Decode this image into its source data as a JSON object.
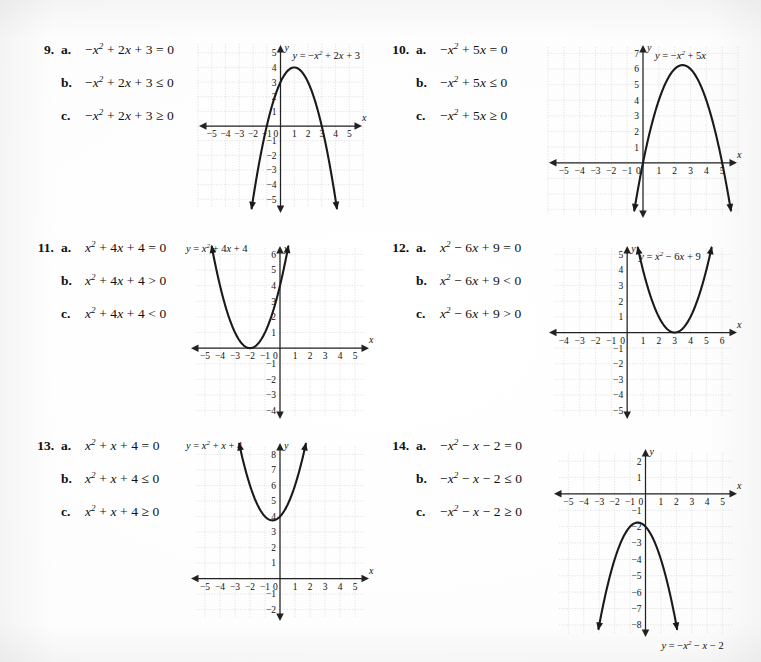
{
  "page": {
    "background": "#ffffff",
    "ink": "#111111",
    "grid_color": "#c9c9c9",
    "axis_color": "#222222",
    "curve_color": "#1a1a1a"
  },
  "problems": [
    {
      "number": "9.",
      "parts": [
        {
          "letter": "a.",
          "expression": "−x² + 2x + 3 = 0"
        },
        {
          "letter": "b.",
          "expression": "−x² + 2x + 3 ≤ 0"
        },
        {
          "letter": "c.",
          "expression": "−x² + 2x + 3 ≥ 0"
        }
      ]
    },
    {
      "number": "10.",
      "parts": [
        {
          "letter": "a.",
          "expression": "−x² + 5x = 0"
        },
        {
          "letter": "b.",
          "expression": "−x² + 5x ≤ 0"
        },
        {
          "letter": "c.",
          "expression": "−x² + 5x ≥ 0"
        }
      ]
    },
    {
      "number": "11.",
      "parts": [
        {
          "letter": "a.",
          "expression": "x² + 4x + 4 = 0"
        },
        {
          "letter": "b.",
          "expression": "x² + 4x + 4 > 0"
        },
        {
          "letter": "c.",
          "expression": "x² + 4x + 4 < 0"
        }
      ]
    },
    {
      "number": "12.",
      "parts": [
        {
          "letter": "a.",
          "expression": "x² − 6x + 9 = 0"
        },
        {
          "letter": "b.",
          "expression": "x² − 6x + 9 < 0"
        },
        {
          "letter": "c.",
          "expression": "x² − 6x + 9 > 0"
        }
      ]
    },
    {
      "number": "13.",
      "parts": [
        {
          "letter": "a.",
          "expression": "x² + x + 4 = 0"
        },
        {
          "letter": "b.",
          "expression": "x² + x + 4 ≤ 0"
        },
        {
          "letter": "c.",
          "expression": "x² + x + 4 ≥ 0"
        }
      ]
    },
    {
      "number": "14.",
      "parts": [
        {
          "letter": "a.",
          "expression": "−x² − x − 2 = 0"
        },
        {
          "letter": "b.",
          "expression": "−x² − x − 2 ≤ 0"
        },
        {
          "letter": "c.",
          "expression": "−x² − x − 2 ≥ 0"
        }
      ]
    }
  ],
  "chart_data": [
    {
      "id": "graph-9",
      "type": "line",
      "title": "y = −x² + 2x + 3",
      "label_text": "y = −x² + 2x + 3",
      "label_pos": "top-right",
      "xlabel": "x",
      "ylabel": "y",
      "coefficients": {
        "a": -1,
        "b": 2,
        "c": 3
      },
      "vertex": [
        1,
        4
      ],
      "roots": [
        -1,
        3
      ],
      "xlim": [
        -6,
        6
      ],
      "ylim": [
        -6,
        5.6
      ],
      "xticks": [
        -5,
        -4,
        -3,
        -2,
        -1,
        0,
        1,
        2,
        3,
        4,
        5
      ],
      "yticks": [
        -5,
        -4,
        -3,
        -2,
        -1,
        1,
        2,
        3,
        4,
        5
      ],
      "xtick_labels": [
        "−5",
        "−4",
        "−3",
        "−2",
        "−1",
        "0",
        "1",
        "2",
        "3",
        "4",
        "5"
      ],
      "ytick_labels": [
        "−5",
        "−4",
        "−3",
        "−2",
        "−1",
        "1",
        "2",
        "3",
        "4",
        "5"
      ],
      "grid": true,
      "grid_x": [
        -6,
        6
      ],
      "grid_y": [
        -5.6,
        5.6
      ],
      "curve_domain": [
        -2.1,
        4.1
      ],
      "arrows": "both-down"
    },
    {
      "id": "graph-10",
      "type": "line",
      "title": "y = −x² + 5x",
      "label_text": "y = −x² + 5x",
      "label_pos": "top-right",
      "xlabel": "x",
      "ylabel": "y",
      "coefficients": {
        "a": -1,
        "b": 5,
        "c": 0
      },
      "vertex": [
        2.5,
        6.25
      ],
      "roots": [
        0,
        5
      ],
      "xlim": [
        -6,
        6
      ],
      "ylim": [
        -3.6,
        7.6
      ],
      "xticks": [
        -5,
        -4,
        -3,
        -2,
        -1,
        0,
        1,
        2,
        3,
        4,
        5
      ],
      "yticks": [
        1,
        2,
        3,
        4,
        5,
        6,
        7
      ],
      "xtick_labels": [
        "−5",
        "−4",
        "−3",
        "−2",
        "−1",
        "0",
        "1",
        "2",
        "3",
        "4",
        "5"
      ],
      "ytick_labels": [
        "1",
        "2",
        "3",
        "4",
        "5",
        "6",
        "7"
      ],
      "grid": true,
      "grid_x": [
        -6,
        6
      ],
      "grid_y": [
        -3.4,
        7.4
      ],
      "curve_domain": [
        -0.55,
        5.55
      ],
      "arrows": "both-down"
    },
    {
      "id": "graph-11",
      "type": "line",
      "title": "y = x² + 4x + 4",
      "label_text": "y = x² + 4x + 4",
      "label_pos": "top-left",
      "xlabel": "x",
      "ylabel": "y",
      "coefficients": {
        "a": 1,
        "b": 4,
        "c": 4
      },
      "vertex": [
        -2,
        0
      ],
      "roots": [
        -2
      ],
      "xlim": [
        -6,
        6
      ],
      "ylim": [
        -4.6,
        6.6
      ],
      "xticks": [
        -5,
        -4,
        -3,
        -2,
        -1,
        0,
        1,
        2,
        3,
        4,
        5
      ],
      "yticks": [
        -4,
        -3,
        -2,
        -1,
        1,
        2,
        3,
        4,
        5,
        6
      ],
      "xtick_labels": [
        "−5",
        "−4",
        "−3",
        "−2",
        "−1",
        "0",
        "1",
        "2",
        "3",
        "4",
        "5"
      ],
      "ytick_labels": [
        "−4",
        "−3",
        "−2",
        "−1",
        "1",
        "2",
        "3",
        "4",
        "5",
        "6"
      ],
      "grid": true,
      "grid_x": [
        -5.6,
        5.6
      ],
      "grid_y": [
        -4.4,
        6.4
      ],
      "curve_domain": [
        -4.55,
        0.55
      ],
      "arrows": "both-up"
    },
    {
      "id": "graph-12",
      "type": "line",
      "title": "y = x² − 6x + 9",
      "label_text": "y = x² − 6x + 9",
      "label_pos": "top-right",
      "xlabel": "x",
      "ylabel": "y",
      "coefficients": {
        "a": 1,
        "b": -6,
        "c": 9
      },
      "vertex": [
        3,
        0
      ],
      "roots": [
        3
      ],
      "xlim": [
        -5,
        7
      ],
      "ylim": [
        -5.6,
        5.6
      ],
      "xticks": [
        -4,
        -3,
        -2,
        -1,
        0,
        1,
        2,
        3,
        4,
        5,
        6
      ],
      "yticks": [
        -5,
        -4,
        -3,
        -2,
        -1,
        1,
        2,
        3,
        4,
        5
      ],
      "xtick_labels": [
        "−4",
        "−3",
        "−2",
        "−1",
        "0",
        "1",
        "2",
        "3",
        "4",
        "5",
        "6"
      ],
      "ytick_labels": [
        "−5",
        "−4",
        "−3",
        "−2",
        "−1",
        "1",
        "2",
        "3",
        "4",
        "5"
      ],
      "grid": true,
      "grid_x": [
        -4.6,
        6.6
      ],
      "grid_y": [
        -5.4,
        5.4
      ],
      "curve_domain": [
        0.67,
        5.33
      ],
      "arrows": "both-up"
    },
    {
      "id": "graph-13",
      "type": "line",
      "title": "y = x² + x + 4",
      "label_text": "y = x² + x + 4",
      "label_pos": "top-left",
      "xlabel": "x",
      "ylabel": "y",
      "coefficients": {
        "a": 1,
        "b": 1,
        "c": 4
      },
      "vertex": [
        -0.5,
        3.75
      ],
      "roots": [],
      "xlim": [
        -6,
        6
      ],
      "ylim": [
        -2.8,
        8.8
      ],
      "xticks": [
        -5,
        -4,
        -3,
        -2,
        -1,
        0,
        1,
        2,
        3,
        4,
        5
      ],
      "yticks": [
        -2,
        -1,
        1,
        2,
        3,
        4,
        5,
        6,
        7,
        8
      ],
      "xtick_labels": [
        "−5",
        "−4",
        "−3",
        "−2",
        "−1",
        "0",
        "1",
        "2",
        "3",
        "4",
        "5"
      ],
      "ytick_labels": [
        "−2",
        "−1",
        "1",
        "2",
        "3",
        "4",
        "5",
        "6",
        "7",
        "8"
      ],
      "grid": true,
      "grid_x": [
        -5.6,
        5.6
      ],
      "grid_y": [
        -2.5,
        8.5
      ],
      "curve_domain": [
        -2.72,
        1.72
      ],
      "arrows": "both-up"
    },
    {
      "id": "graph-14",
      "type": "line",
      "title": "y = −x² − x − 2",
      "label_text": "y = −x² − x − 2",
      "label_pos": "bottom-right",
      "xlabel": "x",
      "ylabel": "y",
      "coefficients": {
        "a": -1,
        "b": -1,
        "c": -2
      },
      "vertex": [
        -0.5,
        -1.75
      ],
      "roots": [],
      "xlim": [
        -6,
        6
      ],
      "ylim": [
        -8.8,
        2.8
      ],
      "xticks": [
        -5,
        -4,
        -3,
        -2,
        -1,
        0,
        1,
        2,
        3,
        4,
        5
      ],
      "yticks": [
        -8,
        -7,
        -6,
        -5,
        -4,
        -3,
        -2,
        -1,
        1,
        2
      ],
      "xtick_labels": [
        "−5",
        "−4",
        "−3",
        "−2",
        "−1",
        "0",
        "1",
        "2",
        "3",
        "4",
        "5"
      ],
      "ytick_labels": [
        "−8",
        "−7",
        "−6",
        "−5",
        "−4",
        "−3",
        "−2",
        "−1",
        "1",
        "2"
      ],
      "grid": true,
      "grid_x": [
        -5.6,
        5.6
      ],
      "grid_y": [
        -8.5,
        2.5
      ],
      "curve_domain": [
        -3.05,
        2.05
      ],
      "arrows": "both-down"
    }
  ],
  "layout": {
    "problem_positions": [
      {
        "left": 28,
        "top": 42
      },
      {
        "left": 383,
        "top": 42
      },
      {
        "left": 28,
        "top": 240
      },
      {
        "left": 383,
        "top": 240
      },
      {
        "left": 28,
        "top": 438
      },
      {
        "left": 383,
        "top": 438
      }
    ],
    "graph_boxes": [
      {
        "left": 198,
        "top": 44,
        "w": 165,
        "h": 170
      },
      {
        "left": 548,
        "top": 44,
        "w": 190,
        "h": 175
      },
      {
        "left": 190,
        "top": 245,
        "w": 180,
        "h": 175
      },
      {
        "left": 548,
        "top": 245,
        "w": 190,
        "h": 175
      },
      {
        "left": 190,
        "top": 442,
        "w": 180,
        "h": 180
      },
      {
        "left": 553,
        "top": 448,
        "w": 185,
        "h": 190
      }
    ]
  }
}
